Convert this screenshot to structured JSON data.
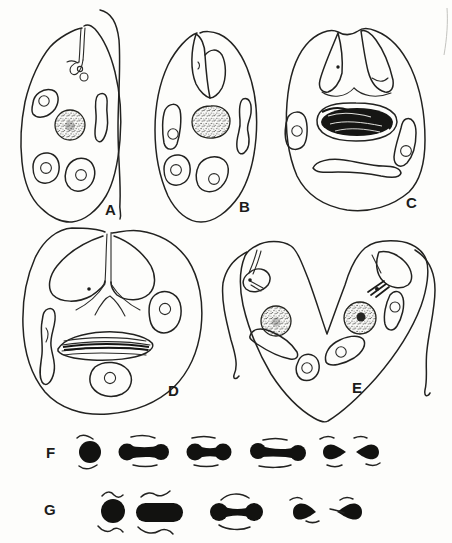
{
  "figure": {
    "background_color": "#fdfdfb",
    "ink_color": "#222220",
    "solid_fill_color": "#121210",
    "panels": [
      {
        "id": "cell-a",
        "label": "A"
      },
      {
        "id": "cell-b",
        "label": "B"
      },
      {
        "id": "cell-c",
        "label": "C"
      },
      {
        "id": "cell-d",
        "label": "D"
      },
      {
        "id": "cell-e",
        "label": "E"
      },
      {
        "id": "nucleus-series-f",
        "label": "F"
      },
      {
        "id": "nucleus-series-g",
        "label": "G"
      }
    ]
  }
}
